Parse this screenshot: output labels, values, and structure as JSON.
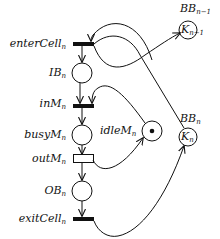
{
  "diagram": {
    "type": "petri-net",
    "colors": {
      "stroke": "#111111",
      "background": "#ffffff",
      "token": "#111111"
    },
    "transitions": [
      {
        "id": "enterCell",
        "label": "enterCell",
        "subscript": "n",
        "style": "filled-bar"
      },
      {
        "id": "inM",
        "label": "inM",
        "subscript": "n",
        "style": "filled-bar"
      },
      {
        "id": "outM",
        "label": "outM",
        "subscript": "n",
        "style": "hollow-box"
      },
      {
        "id": "exitCell",
        "label": "exitCell",
        "subscript": "n",
        "style": "filled-bar"
      }
    ],
    "places": [
      {
        "id": "IB",
        "label": "IB",
        "subscript": "n",
        "tokens": 0
      },
      {
        "id": "busyM",
        "label": "busyM",
        "subscript": "n",
        "tokens": 0
      },
      {
        "id": "OB",
        "label": "OB",
        "subscript": "n",
        "tokens": 0
      },
      {
        "id": "idleM",
        "label": "idleM",
        "subscript": "n",
        "tokens": 1
      },
      {
        "id": "BBprev",
        "label": "BB",
        "subscript": "n−1",
        "capacity_label": "K",
        "capacity_subscript": "n−1",
        "tokens": 0
      },
      {
        "id": "BB",
        "label": "BB",
        "subscript": "n",
        "capacity_label": "K",
        "capacity_subscript": "n",
        "tokens": 0
      }
    ],
    "arcs": [
      {
        "from": "enterCell",
        "to": "IB"
      },
      {
        "from": "IB",
        "to": "inM"
      },
      {
        "from": "idleM",
        "to": "inM"
      },
      {
        "from": "inM",
        "to": "busyM"
      },
      {
        "from": "busyM",
        "to": "outM"
      },
      {
        "from": "outM",
        "to": "idleM"
      },
      {
        "from": "outM",
        "to": "OB"
      },
      {
        "from": "OB",
        "to": "exitCell"
      },
      {
        "from": "BBprev",
        "to": "enterCell"
      },
      {
        "from": "enterCell",
        "to": "BBprev"
      },
      {
        "from": "BB",
        "to": "exitCell"
      },
      {
        "from": "exitCell",
        "to": "BB"
      }
    ]
  }
}
